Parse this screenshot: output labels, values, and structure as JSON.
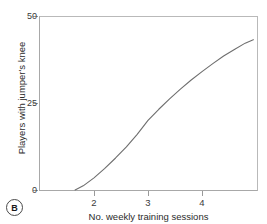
{
  "figure": {
    "panel_label": "B",
    "background_color": "#ffffff",
    "frame_color": "#b9b9b9",
    "curve_color": "#6e6e6e"
  },
  "chart_data": {
    "type": "line",
    "title": "",
    "subtitle": "",
    "xlabel": "No. weekly training sessions",
    "ylabel": "Players with jumper's knee",
    "xlim": [
      1.3,
      4.95
    ],
    "ylim": [
      0,
      50
    ],
    "xticks": [
      2,
      3,
      4
    ],
    "xtick_labels": [
      "2",
      "3",
      "4"
    ],
    "yticks": [
      0,
      25,
      50
    ],
    "ytick_labels": [
      "0",
      "25",
      "50"
    ],
    "grid": false,
    "legend": null,
    "annotations": [
      "B"
    ],
    "series": [
      {
        "name": "Players with jumper's knee",
        "color": "#6e6e6e",
        "x": [
          1.65,
          1.8,
          2.0,
          2.2,
          2.4,
          2.6,
          2.8,
          3.0,
          3.2,
          3.4,
          3.6,
          3.8,
          4.0,
          4.2,
          4.4,
          4.6,
          4.8,
          4.95
        ],
        "values": [
          0,
          1.2,
          3.5,
          6.2,
          9.2,
          12.4,
          16.0,
          20.0,
          23.2,
          26.2,
          29.0,
          31.6,
          34.0,
          36.3,
          38.5,
          40.4,
          42.2,
          43.2
        ]
      }
    ]
  }
}
